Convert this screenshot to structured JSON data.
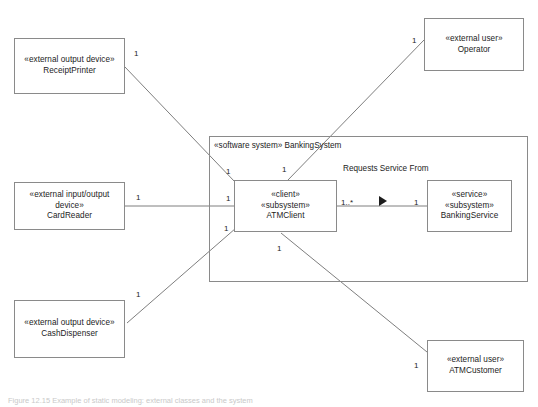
{
  "diagram": {
    "type": "uml-communication-diagram",
    "background_color": "#ffffff",
    "line_color": "#8a8a8a",
    "text_color": "#1c1c1c",
    "caption": "Figure 12.15 Example of static modeling: external classes and the system",
    "container": {
      "stereotype": "«software system»",
      "name": "BankingSystem"
    },
    "nodes": [
      {
        "id": "receipt-printer",
        "stereotype": "«external output device»",
        "name": "ReceiptPrinter",
        "stereotype2": "",
        "multiline_stereotype": false
      },
      {
        "id": "card-reader",
        "stereotype": "«external input/output",
        "stereotype_line2": "device»",
        "name": "CardReader",
        "multiline_stereotype": true
      },
      {
        "id": "cash-dispenser",
        "stereotype": "«external output device»",
        "name": "CashDispenser",
        "multiline_stereotype": false
      },
      {
        "id": "operator",
        "stereotype": "«external user»",
        "name": "Operator",
        "multiline_stereotype": false
      },
      {
        "id": "atm-customer",
        "stereotype": "«external user»",
        "name": "ATMCustomer",
        "multiline_stereotype": false
      },
      {
        "id": "atm-client",
        "stereotype": "«client»",
        "stereotype2": "«subsystem»",
        "name": "ATMClient",
        "multiline_stereotype": false
      },
      {
        "id": "banking-service",
        "stereotype": "«service»",
        "stereotype2": "«subsystem»",
        "name": "BankingService",
        "multiline_stereotype": false
      }
    ],
    "association": {
      "label_line1": "Requests Service",
      "label_line2": "From",
      "source_multiplicity": "1..*",
      "target_multiplicity": "1",
      "direction": "right"
    },
    "multiplicities": {
      "receipt_printer_end": "1",
      "receipt_printer_client_end": "1",
      "operator_end": "1",
      "operator_client_end": "1",
      "card_reader_end": "1",
      "card_reader_client_end": "1",
      "cash_dispenser_end": "1",
      "cash_dispenser_client_end": "1",
      "atm_customer_end": "1",
      "atm_customer_client_end": "1"
    }
  }
}
